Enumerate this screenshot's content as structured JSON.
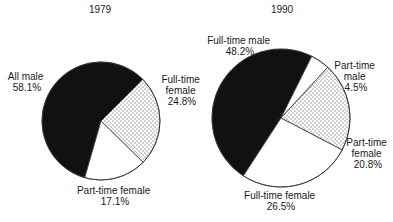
{
  "chart_data": [
    {
      "type": "pie",
      "title": "1979",
      "slices": [
        {
          "label": "All male",
          "value": 58.1,
          "value_label": "58.1%",
          "fill": "black"
        },
        {
          "label": "Full-time female",
          "value": 24.8,
          "value_label": "24.8%",
          "fill": "dots"
        },
        {
          "label": "Part-time female",
          "value": 17.1,
          "value_label": "17.1%",
          "fill": "white"
        }
      ],
      "label_lines": [
        [
          "All male",
          "58.1%"
        ],
        [
          "Full-time",
          "female",
          "24.8%"
        ],
        [
          "Part-time female",
          "17.1%"
        ]
      ]
    },
    {
      "type": "pie",
      "title": "1990",
      "slices": [
        {
          "label": "Full-time male",
          "value": 48.2,
          "value_label": "48.2%",
          "fill": "black"
        },
        {
          "label": "Part-time male",
          "value": 4.5,
          "value_label": "4.5%",
          "fill": "white"
        },
        {
          "label": "Part-time female",
          "value": 20.8,
          "value_label": "20.8%",
          "fill": "dots"
        },
        {
          "label": "Full-time female",
          "value": 26.5,
          "value_label": "26.5%",
          "fill": "white"
        }
      ],
      "label_lines": [
        [
          "Full-time male",
          "48.2%"
        ],
        [
          "Part-time",
          "male",
          "4.5%"
        ],
        [
          "Part-time",
          "female",
          "20.8%"
        ],
        [
          "Full-time female",
          "26.5%"
        ]
      ]
    }
  ],
  "colors": {
    "black_fill": "#111111",
    "white_fill": "#ffffff",
    "dot_color": "#333333",
    "stroke": "#333333"
  }
}
